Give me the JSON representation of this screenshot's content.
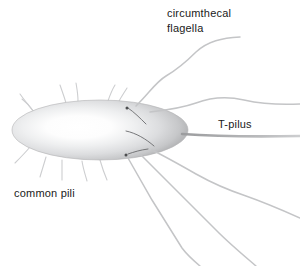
{
  "figure": {
    "background_color": "#ffffff",
    "width": 300,
    "height": 266
  },
  "labels": {
    "flagella_line1": "circumthecal",
    "flagella_line2": "flagella",
    "t_pilus": "T-pilus",
    "common_pili": "common pili"
  },
  "colors": {
    "text": "#1a1a1a",
    "cell_edge": "#b9babc",
    "cell_mid": "#d8d9db",
    "cell_center": "#ffffff",
    "flagellum": "#c6c7c9",
    "pilus": "#cdced0",
    "t_pilus": "#a9aaac",
    "root_line": "#5a5b5d"
  },
  "structures": {
    "cell_body": {
      "name": "cell-body-ellipse",
      "center_x": 100,
      "center_y": 130,
      "radius_x": 88,
      "radius_y": 30
    },
    "flagella_count": 5,
    "common_pili_count": 9,
    "t_pilus_count": 1
  }
}
